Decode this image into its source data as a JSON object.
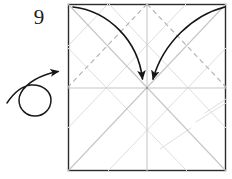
{
  "diagram": {
    "type": "origami-crease-pattern-step",
    "step_number": "9",
    "instruction_icons": [
      "turn-over-arrow",
      "fold-arrow",
      "fold-arrow"
    ],
    "watermark_text": "",
    "colors": {
      "paper_border": "#2b2b2b",
      "paper_fill": "#ffffff",
      "crease_valley": "#c8c8c8",
      "crease_mountain": "#b4b4b4",
      "crease_faint": "#dcdcdc",
      "arrow": "#1a1a1a",
      "step_text": "#1b1b1b",
      "watermark": "#e2e2e2"
    },
    "paper": {
      "shape": "square",
      "left": 68,
      "top": 4,
      "width": 158,
      "height": 167,
      "center_x": 147,
      "center_y": 88
    },
    "creases": [
      {
        "name": "diagonal-tl-br",
        "style": "solid-light",
        "x1": 68,
        "y1": 4,
        "x2": 226,
        "y2": 171
      },
      {
        "name": "diagonal-tr-bl",
        "style": "solid-light",
        "x1": 226,
        "y1": 4,
        "x2": 68,
        "y2": 171
      },
      {
        "name": "horizontal-midline",
        "style": "solid-light",
        "x1": 68,
        "y1": 88,
        "x2": 226,
        "y2": 88
      },
      {
        "name": "vertical-midline",
        "style": "solid-light",
        "x1": 147,
        "y1": 4,
        "x2": 147,
        "y2": 171
      },
      {
        "name": "dashed-top-left-diagonal",
        "style": "dashed",
        "x1": 147,
        "y1": 4,
        "x2": 68,
        "y2": 88
      },
      {
        "name": "dashed-top-right-diagonal",
        "style": "dashed",
        "x1": 147,
        "y1": 4,
        "x2": 226,
        "y2": 88
      },
      {
        "name": "offset-diagonal-upper-left",
        "style": "solid-faint",
        "x1": 108,
        "y1": 4,
        "x2": 68,
        "y2": 46
      },
      {
        "name": "offset-diagonal-upper-left-long",
        "style": "solid-faint",
        "x1": 109,
        "y1": 4,
        "x2": 226,
        "y2": 128
      },
      {
        "name": "offset-diagonal-upper-right-long",
        "style": "solid-faint",
        "x1": 186,
        "y1": 4,
        "x2": 68,
        "y2": 128
      },
      {
        "name": "offset-diagonal-lower-left",
        "style": "solid-faint",
        "x1": 68,
        "y1": 48,
        "x2": 187,
        "y2": 171
      },
      {
        "name": "offset-diagonal-lower-right",
        "style": "solid-faint",
        "x1": 226,
        "y1": 48,
        "x2": 108,
        "y2": 171
      },
      {
        "name": "short-crease-right-a",
        "style": "solid-faint",
        "x1": 196,
        "y1": 122,
        "x2": 226,
        "y2": 104
      },
      {
        "name": "short-crease-right-b",
        "style": "solid-faint",
        "x1": 160,
        "y1": 148,
        "x2": 190,
        "y2": 128
      },
      {
        "name": "short-crease-right-c",
        "style": "solid-faint",
        "x1": 206,
        "y1": 112,
        "x2": 226,
        "y2": 100
      }
    ],
    "arrows": [
      {
        "name": "fold-arrow-left",
        "description": "curved arrow from top-left corner to center",
        "path": "M 74 8 C 110 12, 140 42, 143 80",
        "head_x": 143,
        "head_y": 86,
        "head_angle": 80
      },
      {
        "name": "fold-arrow-right",
        "description": "curved arrow from top-right corner to center",
        "path": "M 224 8 C 192 16, 162 44, 153 80",
        "head_x": 152,
        "head_y": 86,
        "head_angle": 103
      },
      {
        "name": "turn-over-arrow",
        "description": "looping turn-the-model-over symbol at left",
        "path": "M 8 103 C 16 95, 24 88, 34 88 C 46 88, 52 96, 52 103 C 52 110, 46 117, 36 117 C 26 117, 20 110, 20 103 C 20 94, 30 82, 44 77 C 50 75, 56 74, 60 73",
        "head_x": 62,
        "head_y": 72,
        "head_angle": -16
      }
    ]
  }
}
